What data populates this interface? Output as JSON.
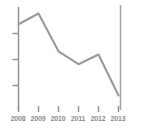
{
  "chart_data": {
    "type": "line",
    "title": "",
    "subtitle": "",
    "xlabel": "",
    "ylabel": "",
    "categories": [
      "2008",
      "2009",
      "2010",
      "2011",
      "2012",
      "2013"
    ],
    "values": [
      78,
      88,
      53,
      41,
      50,
      12
    ],
    "series": [
      {
        "name": "",
        "values": [
          78,
          88,
          53,
          41,
          50,
          12
        ]
      }
    ],
    "xlim": [
      2008,
      2013
    ],
    "ylim": [
      0,
      100
    ],
    "grid": false,
    "legend": false,
    "legend_position": "none",
    "annotations": [],
    "y_tick_labels": [],
    "y_tick_count": 3
  },
  "axes": {
    "line_color": "#9a9a9a",
    "axis_color": "#8f8f8f",
    "tick_color": "#8f8f8f",
    "label_color": "#8c8c8c",
    "background": "#ffffff",
    "right_border_color": "#a5a5a5"
  },
  "x_labels": [
    {
      "text": "2008"
    },
    {
      "text": "2009"
    },
    {
      "text": "2010"
    },
    {
      "text": "2011"
    },
    {
      "text": "2012"
    },
    {
      "text": "2013"
    }
  ]
}
